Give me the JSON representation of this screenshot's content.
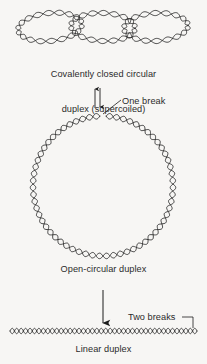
{
  "figure": {
    "background_color": "#f7f6f4",
    "stroke_color": "#1c1c1c",
    "text_color": "#2b2b2b",
    "width": 207,
    "height": 364
  },
  "panels": [
    {
      "id": "supercoiled",
      "shape": "covalently-closed-supercoiled-duplex",
      "caption": "Covalently closed circular\nduplex (supercoiled)",
      "caption_line1": "Covalently closed circular",
      "caption_line2": "duplex (supercoiled)",
      "loops": 3
    },
    {
      "id": "open-circular",
      "shape": "open-circular-duplex",
      "caption": "Open-circular duplex",
      "circle": {
        "center_x": 103,
        "center_y": 186,
        "radius": 70
      }
    },
    {
      "id": "linear",
      "shape": "linear-duplex",
      "caption": "Linear duplex",
      "line": {
        "start_x": 10,
        "end_x": 197,
        "y": 331
      }
    }
  ],
  "transitions": [
    {
      "id": "one-break",
      "label": "One break",
      "arrow_type": "equilibrium-double-arrow",
      "arrow_x": 97,
      "arrow_top": 88,
      "arrow_bottom": 108,
      "leader_from_x": 120,
      "leader_from_y": 101,
      "leader_to_x": 103,
      "leader_to_y": 113
    },
    {
      "id": "two-breaks",
      "label": "Two breaks",
      "arrow_type": "single-down-arrow",
      "arrow_x": 103,
      "arrow_top": 290,
      "arrow_bottom": 322,
      "leader_from_x": 184,
      "leader_from_y": 317,
      "leader_to_x": 193,
      "leader_to_y": 329
    }
  ]
}
